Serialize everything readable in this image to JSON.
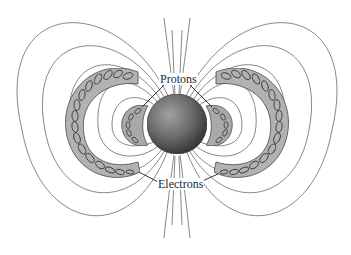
{
  "diagram": {
    "labels": {
      "protons": "Protons",
      "electrons": "Electrons"
    },
    "components": {
      "central_body": "planet-sphere",
      "inner_belts": "proton belts (inner, left and right)",
      "outer_belts": "electron belts (outer, left and right)",
      "field_lines": "dipole magnetic field lines"
    },
    "colors": {
      "background": "#ffffff",
      "field_line": "#7a7a7a",
      "belt_fill": "#b9b9b9",
      "spiral": "#3a3a3a",
      "sphere_dark": "#3c3c3c",
      "sphere_light": "#a8a8a8",
      "text": "#2a2a2a"
    }
  }
}
